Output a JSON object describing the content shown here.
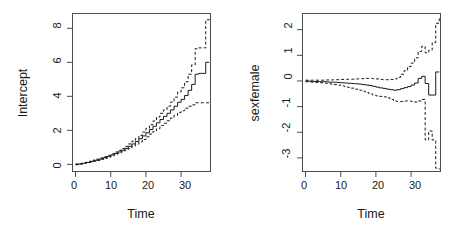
{
  "figure": {
    "background": "#ffffff",
    "line_color": "#1a1a1a",
    "axis_color": "#4d4d4d",
    "panels": 2,
    "layout": "1 row x 2 columns"
  },
  "chart_data": [
    {
      "type": "line",
      "panel": "left",
      "title": "",
      "xlabel": "Time",
      "ylabel": "Intercept",
      "xlim": [
        -1.0,
        38.5
      ],
      "ylim": [
        -0.45,
        8.9
      ],
      "xticks": [
        0,
        10,
        20,
        30
      ],
      "yticks": [
        0,
        2,
        4,
        6,
        8
      ],
      "grid": false,
      "legend": false,
      "series": [
        {
          "name": "cumulative coefficient estimate",
          "style": "solid",
          "x": [
            0,
            1,
            2,
            3,
            4,
            5,
            6,
            7,
            8,
            9,
            10,
            11,
            12,
            13,
            14,
            15,
            16,
            17,
            18,
            19,
            20,
            21,
            22,
            23,
            24,
            25,
            26,
            27,
            28,
            29,
            30,
            31,
            32,
            33,
            34,
            35,
            36,
            37,
            38
          ],
          "y": [
            0.0,
            0.03,
            0.07,
            0.11,
            0.16,
            0.21,
            0.27,
            0.33,
            0.4,
            0.47,
            0.55,
            0.64,
            0.73,
            0.83,
            0.94,
            1.06,
            1.2,
            1.34,
            1.5,
            1.67,
            1.86,
            2.05,
            2.24,
            2.44,
            2.64,
            2.82,
            3.0,
            3.2,
            3.42,
            3.65,
            3.82,
            4.05,
            4.35,
            4.7,
            5.3,
            5.35,
            5.35,
            6.0,
            6.0
          ]
        },
        {
          "name": "upper 95% confidence limit",
          "style": "dashed",
          "x": [
            0,
            1,
            2,
            3,
            4,
            5,
            6,
            7,
            8,
            9,
            10,
            11,
            12,
            13,
            14,
            15,
            16,
            17,
            18,
            19,
            20,
            21,
            22,
            23,
            24,
            25,
            26,
            27,
            28,
            29,
            30,
            31,
            32,
            33,
            34,
            35,
            36,
            37,
            38
          ],
          "y": [
            0.02,
            0.05,
            0.09,
            0.14,
            0.19,
            0.25,
            0.31,
            0.38,
            0.45,
            0.53,
            0.62,
            0.72,
            0.82,
            0.93,
            1.06,
            1.2,
            1.36,
            1.52,
            1.7,
            1.9,
            2.12,
            2.33,
            2.55,
            2.78,
            3.0,
            3.2,
            3.42,
            3.66,
            3.95,
            4.25,
            4.5,
            4.85,
            5.3,
            5.85,
            6.8,
            6.85,
            6.85,
            8.5,
            8.6
          ]
        },
        {
          "name": "lower 95% confidence limit",
          "style": "dashed",
          "x": [
            0,
            1,
            2,
            3,
            4,
            5,
            6,
            7,
            8,
            9,
            10,
            11,
            12,
            13,
            14,
            15,
            16,
            17,
            18,
            19,
            20,
            21,
            22,
            23,
            24,
            25,
            26,
            27,
            28,
            29,
            30,
            31,
            32,
            33,
            34,
            35,
            36,
            37,
            38
          ],
          "y": [
            -0.02,
            0.01,
            0.05,
            0.09,
            0.13,
            0.18,
            0.23,
            0.29,
            0.35,
            0.42,
            0.49,
            0.57,
            0.65,
            0.74,
            0.84,
            0.94,
            1.06,
            1.18,
            1.32,
            1.46,
            1.62,
            1.78,
            1.94,
            2.1,
            2.28,
            2.42,
            2.56,
            2.72,
            2.88,
            3.05,
            3.15,
            3.3,
            3.42,
            3.5,
            3.62,
            3.62,
            3.62,
            3.62,
            3.62
          ]
        }
      ]
    },
    {
      "type": "line",
      "panel": "right",
      "title": "",
      "xlabel": "Time",
      "ylabel": "sexfemale",
      "xlim": [
        -1.0,
        38.5
      ],
      "ylim": [
        -3.55,
        2.65
      ],
      "xticks": [
        0,
        10,
        20,
        30
      ],
      "yticks": [
        -3,
        -2,
        -1,
        0,
        1,
        2
      ],
      "grid": false,
      "legend": false,
      "series": [
        {
          "name": "cumulative coefficient estimate",
          "style": "solid",
          "x": [
            0,
            1,
            2,
            3,
            4,
            5,
            6,
            7,
            8,
            9,
            10,
            11,
            12,
            13,
            14,
            15,
            16,
            17,
            18,
            19,
            20,
            21,
            22,
            23,
            24,
            25,
            26,
            27,
            28,
            29,
            30,
            31,
            32,
            33,
            34,
            35,
            36,
            37,
            38
          ],
          "y": [
            0.0,
            -0.01,
            -0.02,
            -0.02,
            -0.03,
            -0.03,
            -0.04,
            -0.05,
            -0.05,
            -0.06,
            -0.07,
            -0.08,
            -0.09,
            -0.1,
            -0.11,
            -0.12,
            -0.14,
            -0.16,
            -0.18,
            -0.21,
            -0.24,
            -0.27,
            -0.29,
            -0.32,
            -0.34,
            -0.36,
            -0.34,
            -0.3,
            -0.26,
            -0.22,
            -0.16,
            -0.08,
            0.1,
            0.18,
            -0.1,
            -0.55,
            -0.55,
            0.35,
            0.35
          ]
        },
        {
          "name": "upper 95% confidence limit",
          "style": "dashed",
          "x": [
            0,
            1,
            2,
            3,
            4,
            5,
            6,
            7,
            8,
            9,
            10,
            11,
            12,
            13,
            14,
            15,
            16,
            17,
            18,
            19,
            20,
            21,
            22,
            23,
            24,
            25,
            26,
            27,
            28,
            29,
            30,
            31,
            32,
            33,
            34,
            35,
            36,
            37,
            38
          ],
          "y": [
            0.03,
            0.03,
            0.03,
            0.03,
            0.03,
            0.03,
            0.04,
            0.04,
            0.05,
            0.05,
            0.06,
            0.06,
            0.07,
            0.07,
            0.08,
            0.08,
            0.09,
            0.1,
            0.1,
            0.09,
            0.08,
            0.06,
            0.05,
            0.05,
            0.06,
            0.08,
            0.14,
            0.26,
            0.4,
            0.56,
            0.7,
            0.9,
            1.15,
            1.35,
            1.1,
            1.2,
            1.5,
            2.25,
            2.45
          ]
        },
        {
          "name": "lower 95% confidence limit",
          "style": "dashed",
          "x": [
            0,
            1,
            2,
            3,
            4,
            5,
            6,
            7,
            8,
            9,
            10,
            11,
            12,
            13,
            14,
            15,
            16,
            17,
            18,
            19,
            20,
            21,
            22,
            23,
            24,
            25,
            26,
            27,
            28,
            29,
            30,
            31,
            32,
            33,
            34,
            35,
            36,
            37,
            38
          ],
          "y": [
            -0.03,
            -0.04,
            -0.05,
            -0.06,
            -0.07,
            -0.08,
            -0.1,
            -0.12,
            -0.14,
            -0.16,
            -0.19,
            -0.22,
            -0.25,
            -0.28,
            -0.32,
            -0.36,
            -0.4,
            -0.45,
            -0.5,
            -0.55,
            -0.58,
            -0.6,
            -0.62,
            -0.66,
            -0.72,
            -0.78,
            -0.8,
            -0.8,
            -0.78,
            -0.78,
            -0.8,
            -0.82,
            -0.78,
            -0.72,
            -2.3,
            -1.95,
            -2.3,
            -3.4,
            -3.45
          ]
        }
      ]
    }
  ]
}
